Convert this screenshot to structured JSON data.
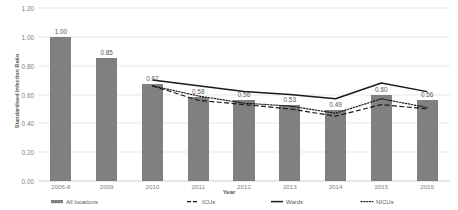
{
  "chart_data": {
    "type": "bar",
    "title": "",
    "xlabel": "Year",
    "ylabel": "Standardised Infection Ratio",
    "ylim": [
      0.0,
      1.2
    ],
    "ytick_step": 0.2,
    "ytick_labels": [
      "0.00",
      "0.20",
      "0.40",
      "0.60",
      "0.80",
      "1.00",
      "1.20"
    ],
    "ytick_values": [
      0.0,
      0.2,
      0.4,
      0.6,
      0.8,
      1.0,
      1.2
    ],
    "grid": true,
    "legend_position": "bottom",
    "categories": [
      "2006-8",
      "2009",
      "2010",
      "2011",
      "2012",
      "2013",
      "2014",
      "2015",
      "2016"
    ],
    "series": [
      {
        "name": "All locations",
        "render": "bar",
        "color": "#808080",
        "values": [
          1.0,
          0.85,
          0.67,
          0.58,
          0.56,
          0.53,
          0.49,
          0.6,
          0.56
        ],
        "data_labels": [
          "1.00",
          "0.85",
          "0.67",
          "0.58",
          "0.56",
          "0.53",
          "0.49",
          "0.60",
          "0.56"
        ]
      },
      {
        "name": "ICUs",
        "render": "line",
        "style": "dashed",
        "color": "#1a1a1a",
        "values": [
          null,
          null,
          0.66,
          0.56,
          0.53,
          0.5,
          0.45,
          0.53,
          0.5
        ]
      },
      {
        "name": "Wards",
        "render": "line",
        "style": "solid",
        "color": "#1a1a1a",
        "values": [
          null,
          null,
          0.7,
          0.66,
          0.62,
          0.6,
          0.57,
          0.68,
          0.62
        ]
      },
      {
        "name": "NICUs",
        "render": "line",
        "style": "dotted",
        "color": "#1a1a1a",
        "values": [
          null,
          null,
          0.66,
          0.59,
          0.54,
          0.52,
          0.47,
          0.57,
          0.51
        ]
      }
    ]
  },
  "legend": {
    "items": [
      {
        "label": "All locations",
        "marker": "bar-swatch"
      },
      {
        "label": "ICUs",
        "marker": "dashed-line"
      },
      {
        "label": "Wards",
        "marker": "solid-line"
      },
      {
        "label": "NICUs",
        "marker": "dotted-line"
      }
    ]
  }
}
